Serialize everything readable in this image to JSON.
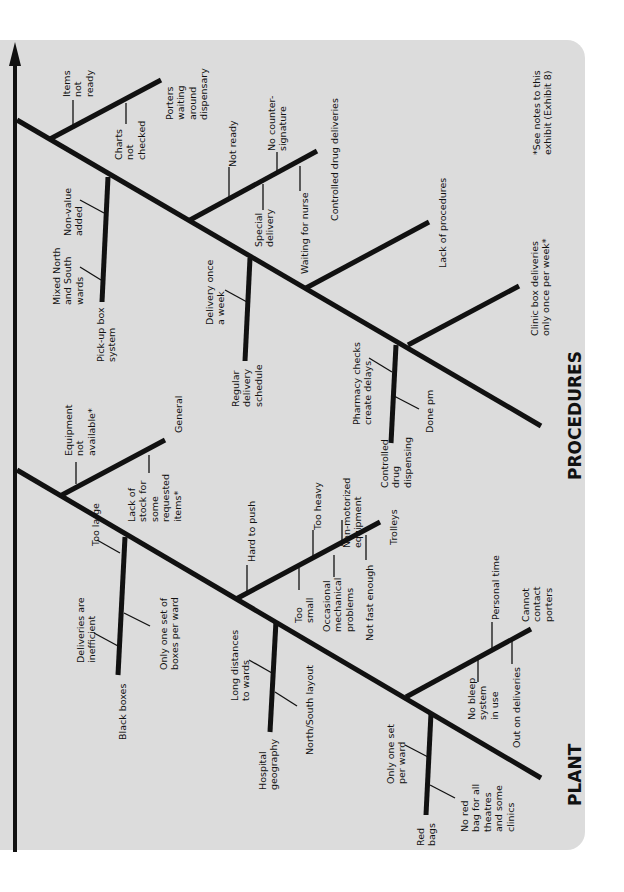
{
  "diagram": {
    "type": "fishbone",
    "orientation": "rotated-90-ccw",
    "colors": {
      "panel": "#dcdcdc",
      "line": "#111111",
      "text": "#111111",
      "background": "#ffffff"
    },
    "spine": {
      "x1": 15,
      "y1": 852,
      "x2": 15,
      "y2": 42,
      "label": ""
    },
    "footnote": {
      "lines": [
        "*See notes to this",
        "exhibit (Exhibit 8)"
      ],
      "x": 530,
      "y": 155
    },
    "categories": [
      {
        "name": "PROCEDURES",
        "label_pos": {
          "x": 565,
          "y": 480
        },
        "bone": {
          "x1": 17,
          "y1": 120,
          "x2": 541,
          "y2": 426
        },
        "causes": [
          {
            "name": "Porters waiting around dispensary",
            "lines": [
              "Porters",
              "waiting",
              "around",
              "dispensary"
            ],
            "bone": {
              "x1": 50,
              "y1": 139,
              "x2": 161,
              "y2": 80
            },
            "label_pos": {
              "x": 163,
              "y": 120
            },
            "sub_causes": [
              {
                "lines": [
                  "Items",
                  "not",
                  "ready"
                ],
                "tick": {
                  "x1": 73,
                  "y1": 100,
                  "x2": 73,
                  "y2": 125
                },
                "label_pos": {
                  "x": 60,
                  "y": 97
                }
              },
              {
                "lines": [
                  "Charts",
                  "not",
                  "checked"
                ],
                "tick": {
                  "x1": 126,
                  "y1": 103,
                  "x2": 126,
                  "y2": 124
                },
                "label_pos": {
                  "x": 112,
                  "y": 160
                }
              }
            ]
          },
          {
            "name": "Pick-up box system",
            "lines": [
              "Pick-up box",
              "system"
            ],
            "bone": {
              "x1": 108,
              "y1": 177,
              "x2": 102,
              "y2": 302
            },
            "label_pos": {
              "x": 94,
              "y": 362
            },
            "sub_causes": [
              {
                "lines": [
                  "Non-value",
                  "added"
                ],
                "tick": {
                  "x1": 80,
                  "y1": 200,
                  "x2": 104,
                  "y2": 213
                },
                "label_pos": {
                  "x": 61,
                  "y": 236
                }
              },
              {
                "lines": [
                  "Mixed North",
                  "and South",
                  "wards"
                ],
                "tick": {
                  "x1": 80,
                  "y1": 267,
                  "x2": 101,
                  "y2": 280
                },
                "label_pos": {
                  "x": 50,
                  "y": 305
                }
              }
            ]
          },
          {
            "name": "Controlled drug deliveries",
            "lines": [
              "Controlled drug deliveries"
            ],
            "bone": {
              "x1": 190,
              "y1": 220,
              "x2": 317,
              "y2": 151
            },
            "label_pos": {
              "x": 328,
              "y": 221
            },
            "sub_causes": [
              {
                "lines": [
                  "Not ready"
                ],
                "tick": {
                  "x1": 229,
                  "y1": 167,
                  "x2": 229,
                  "y2": 198
                },
                "label_pos": {
                  "x": 226,
                  "y": 167
                }
              },
              {
                "lines": [
                  "No counter-",
                  "signature"
                ],
                "tick": {
                  "x1": 277,
                  "y1": 152,
                  "x2": 277,
                  "y2": 171
                },
                "label_pos": {
                  "x": 265,
                  "y": 151
                }
              },
              {
                "lines": [
                  "Special",
                  "delivery"
                ],
                "tick": {
                  "x1": 263,
                  "y1": 184,
                  "x2": 263,
                  "y2": 210
                },
                "label_pos": {
                  "x": 252,
                  "y": 247
                }
              },
              {
                "lines": [
                  "Waiting for nurse"
                ],
                "tick": {
                  "x1": 300,
                  "y1": 166,
                  "x2": 300,
                  "y2": 191
                },
                "label_pos": {
                  "x": 298,
                  "y": 274
                }
              }
            ]
          },
          {
            "name": "Regular delivery schedule",
            "lines": [
              "Regular",
              "delivery",
              "schedule"
            ],
            "bone": {
              "x1": 250,
              "y1": 258,
              "x2": 245,
              "y2": 361
            },
            "label_pos": {
              "x": 229,
              "y": 407
            },
            "sub_causes": [
              {
                "lines": [
                  "Delivery once",
                  "a week"
                ],
                "tick": {
                  "x1": 225,
                  "y1": 290,
                  "x2": 247,
                  "y2": 302
                },
                "label_pos": {
                  "x": 203,
                  "y": 325
                }
              }
            ]
          },
          {
            "name": "Lack of procedures",
            "lines": [
              "Lack of procedures"
            ],
            "bone": {
              "x1": 306,
              "y1": 288,
              "x2": 429,
              "y2": 222
            },
            "label_pos": {
              "x": 436,
              "y": 268
            },
            "sub_causes": []
          },
          {
            "name": "Controlled drug dispensing",
            "lines": [
              "Controlled",
              "drug",
              "dispensing"
            ],
            "bone": {
              "x1": 396,
              "y1": 345,
              "x2": 391,
              "y2": 443
            },
            "label_pos": {
              "x": 378,
              "y": 488
            },
            "sub_causes": [
              {
                "lines": [
                  "Pharmacy checks",
                  "create delays"
                ],
                "tick": {
                  "x1": 369,
                  "y1": 358,
                  "x2": 392,
                  "y2": 372
                },
                "label_pos": {
                  "x": 350,
                  "y": 425
                }
              },
              {
                "lines": [
                  "Done pm"
                ],
                "tick": {
                  "x1": 394,
                  "y1": 396,
                  "x2": 419,
                  "y2": 409
                },
                "label_pos": {
                  "x": 423,
                  "y": 433
                }
              }
            ]
          },
          {
            "name": "Clinic box deliveries only once per week*",
            "lines": [
              "Clinic box deliveries",
              "only once per week*"
            ],
            "bone": {
              "x1": 408,
              "y1": 345,
              "x2": 519,
              "y2": 286
            },
            "label_pos": {
              "x": 528,
              "y": 336
            },
            "sub_causes": []
          }
        ]
      },
      {
        "name": "PLANT",
        "label_pos": {
          "x": 565,
          "y": 806
        },
        "bone": {
          "x1": 17,
          "y1": 470,
          "x2": 541,
          "y2": 778
        },
        "causes": [
          {
            "name": "General",
            "lines": [
              "General"
            ],
            "bone": {
              "x1": 60,
              "y1": 496,
              "x2": 165,
              "y2": 440
            },
            "label_pos": {
              "x": 172,
              "y": 433
            },
            "sub_causes": [
              {
                "lines": [
                  "Equipment",
                  "not",
                  "available*"
                ],
                "tick": {
                  "x1": 76,
                  "y1": 462,
                  "x2": 76,
                  "y2": 484
                },
                "label_pos": {
                  "x": 62,
                  "y": 456
                }
              },
              {
                "lines": [
                  "Lack of",
                  "stock for",
                  "some",
                  "requested",
                  "items*"
                ],
                "tick": {
                  "x1": 149,
                  "y1": 455,
                  "x2": 149,
                  "y2": 473
                },
                "label_pos": {
                  "x": 125,
                  "y": 522
                }
              }
            ]
          },
          {
            "name": "Black boxes",
            "lines": [
              "Black boxes"
            ],
            "bone": {
              "x1": 125,
              "y1": 537,
              "x2": 118,
              "y2": 675
            },
            "label_pos": {
              "x": 116,
              "y": 740
            },
            "sub_causes": [
              {
                "lines": [
                  "Too large"
                ],
                "tick": {
                  "x1": 97,
                  "y1": 540,
                  "x2": 120,
                  "y2": 553
                },
                "label_pos": {
                  "x": 89,
                  "y": 546
                }
              },
              {
                "lines": [
                  "Deliveries are",
                  "inefficient"
                ],
                "tick": {
                  "x1": 94,
                  "y1": 633,
                  "x2": 118,
                  "y2": 646
                },
                "label_pos": {
                  "x": 74,
                  "y": 663
                }
              },
              {
                "lines": [
                  "Only one set of",
                  "boxes per ward"
                ],
                "tick": {
                  "x1": 124,
                  "y1": 613,
                  "x2": 150,
                  "y2": 626
                },
                "label_pos": {
                  "x": 157,
                  "y": 670
                }
              }
            ]
          },
          {
            "name": "Trolleys",
            "lines": [
              "Trolleys"
            ],
            "bone": {
              "x1": 236,
              "y1": 599,
              "x2": 380,
              "y2": 522
            },
            "label_pos": {
              "x": 387,
              "y": 545
            },
            "sub_causes": [
              {
                "lines": [
                  "Hard to push"
                ],
                "tick": {
                  "x1": 247,
                  "y1": 565,
                  "x2": 247,
                  "y2": 592
                },
                "label_pos": {
                  "x": 245,
                  "y": 562
                }
              },
              {
                "lines": [
                  "Too",
                  "small"
                ],
                "tick": {
                  "x1": 299,
                  "y1": 568,
                  "x2": 299,
                  "y2": 590
                },
                "label_pos": {
                  "x": 292,
                  "y": 623
                }
              },
              {
                "lines": [
                  "Too heavy"
                ],
                "tick": {
                  "x1": 313,
                  "y1": 530,
                  "x2": 313,
                  "y2": 556
                },
                "label_pos": {
                  "x": 311,
                  "y": 530
                }
              },
              {
                "lines": [
                  "Occasional",
                  "mechanical",
                  "problems"
                ],
                "tick": {
                  "x1": 334,
                  "y1": 555,
                  "x2": 334,
                  "y2": 577
                },
                "label_pos": {
                  "x": 320,
                  "y": 632
                }
              },
              {
                "lines": [
                  "Non-motorized",
                  "equipment"
                ],
                "tick": {
                  "x1": 342,
                  "y1": 520,
                  "x2": 342,
                  "y2": 546
                },
                "label_pos": {
                  "x": 340,
                  "y": 548
                }
              },
              {
                "lines": [
                  "Not fast enough"
                ],
                "tick": {
                  "x1": 366,
                  "y1": 535,
                  "x2": 366,
                  "y2": 560
                },
                "label_pos": {
                  "x": 363,
                  "y": 641
                }
              }
            ]
          },
          {
            "name": "Hospital geography",
            "lines": [
              "Hospital",
              "geography"
            ],
            "bone": {
              "x1": 276,
              "y1": 621,
              "x2": 270,
              "y2": 732
            },
            "label_pos": {
              "x": 256,
              "y": 790
            },
            "sub_causes": [
              {
                "lines": [
                  "Long distances",
                  "to wards"
                ],
                "tick": {
                  "x1": 249,
                  "y1": 660,
                  "x2": 272,
                  "y2": 673
                },
                "label_pos": {
                  "x": 228,
                  "y": 701
                }
              },
              {
                "lines": [
                  "North/South layout"
                ],
                "tick": {
                  "x1": 275,
                  "y1": 692,
                  "x2": 297,
                  "y2": 706
                },
                "label_pos": {
                  "x": 303,
                  "y": 755
                }
              }
            ]
          },
          {
            "name": "Cannot contact porters",
            "lines": [
              "Cannot",
              "contact",
              "porters"
            ],
            "bone": {
              "x1": 406,
              "y1": 697,
              "x2": 531,
              "y2": 629
            },
            "label_pos": {
              "x": 519,
              "y": 622
            },
            "sub_causes": [
              {
                "lines": [
                  "Personal time"
                ],
                "tick": {
                  "x1": 492,
                  "y1": 622,
                  "x2": 492,
                  "y2": 650
                },
                "label_pos": {
                  "x": 489,
                  "y": 620
                }
              },
              {
                "lines": [
                  "No bleep",
                  "system",
                  "in use"
                ],
                "tick": {
                  "x1": 478,
                  "y1": 660,
                  "x2": 478,
                  "y2": 682
                },
                "label_pos": {
                  "x": 465,
                  "y": 720
                }
              },
              {
                "lines": [
                  "Out on deliveries"
                ],
                "tick": {
                  "x1": 512,
                  "y1": 640,
                  "x2": 512,
                  "y2": 664
                },
                "label_pos": {
                  "x": 510,
                  "y": 748
                }
              }
            ]
          },
          {
            "name": "Red bags",
            "lines": [
              "Red",
              "bags"
            ],
            "bone": {
              "x1": 431,
              "y1": 713,
              "x2": 426,
              "y2": 815
            },
            "label_pos": {
              "x": 414,
              "y": 846
            },
            "sub_causes": [
              {
                "lines": [
                  "Only one set",
                  "per ward"
                ],
                "tick": {
                  "x1": 405,
                  "y1": 745,
                  "x2": 428,
                  "y2": 757
                },
                "label_pos": {
                  "x": 384,
                  "y": 784
                }
              },
              {
                "lines": [
                  "No red",
                  "bag for all",
                  "theatres",
                  "and some",
                  "clinics"
                ],
                "tick": {
                  "x1": 430,
                  "y1": 785,
                  "x2": 455,
                  "y2": 798
                },
                "label_pos": {
                  "x": 458,
                  "y": 832
                }
              }
            ]
          }
        ]
      }
    ]
  }
}
